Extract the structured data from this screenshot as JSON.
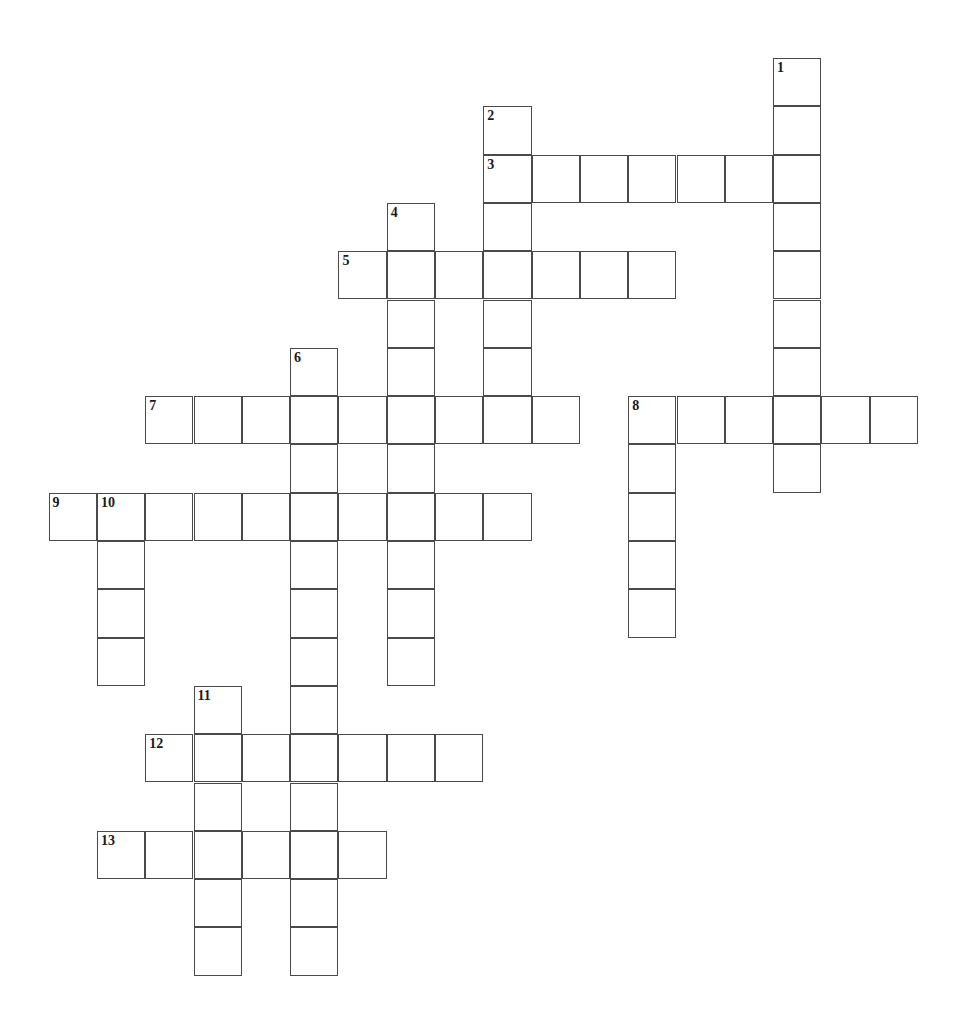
{
  "puzzle": {
    "type": "crossword-grid",
    "title": "Crossword Puzzle",
    "canvas_width": 971,
    "canvas_height": 1034,
    "background_color": "#ffffff",
    "cell_size": 48.3,
    "origin_x": 48.6,
    "origin_y": 58.0,
    "cell_border_color": "#4a4a4a",
    "cell_border_width": 1.4,
    "cell_fill_color": "#ffffff",
    "number_color": "#1a1a1a",
    "number_font_size": 14,
    "total_numbers": 13,
    "total_cells": 98,
    "entries": [
      {
        "number": "1",
        "direction": "down",
        "col": 15,
        "row": 0,
        "length": 9
      },
      {
        "number": "2",
        "direction": "down",
        "col": 9,
        "row": 1,
        "length": 7
      },
      {
        "number": "3",
        "direction": "across",
        "col": 9,
        "row": 2,
        "length": 7
      },
      {
        "number": "4",
        "direction": "down",
        "col": 7,
        "row": 3,
        "length": 10
      },
      {
        "number": "5",
        "direction": "across",
        "col": 6,
        "row": 4,
        "length": 7
      },
      {
        "number": "6",
        "direction": "down",
        "col": 5,
        "row": 6,
        "length": 13
      },
      {
        "number": "7",
        "direction": "across",
        "col": 2,
        "row": 7,
        "length": 9
      },
      {
        "number": "8",
        "direction": "across",
        "col": 12,
        "row": 7,
        "length": 6
      },
      {
        "number": "8",
        "direction": "down",
        "col": 12,
        "row": 7,
        "length": 5
      },
      {
        "number": "9",
        "direction": "across",
        "col": 0,
        "row": 9,
        "length": 10
      },
      {
        "number": "10",
        "direction": "down",
        "col": 1,
        "row": 9,
        "length": 4
      },
      {
        "number": "11",
        "direction": "down",
        "col": 3,
        "row": 13,
        "length": 6
      },
      {
        "number": "12",
        "direction": "across",
        "col": 2,
        "row": 14,
        "length": 7
      },
      {
        "number": "13",
        "direction": "across",
        "col": 1,
        "row": 16,
        "length": 6
      }
    ],
    "numbered_cells": [
      {
        "label": "1",
        "col": 15,
        "row": 0
      },
      {
        "label": "2",
        "col": 9,
        "row": 1
      },
      {
        "label": "3",
        "col": 9,
        "row": 2
      },
      {
        "label": "4",
        "col": 7,
        "row": 3
      },
      {
        "label": "5",
        "col": 6,
        "row": 4
      },
      {
        "label": "6",
        "col": 5,
        "row": 6
      },
      {
        "label": "7",
        "col": 2,
        "row": 7
      },
      {
        "label": "8",
        "col": 12,
        "row": 7
      },
      {
        "label": "9",
        "col": 0,
        "row": 9
      },
      {
        "label": "10",
        "col": 1,
        "row": 9
      },
      {
        "label": "11",
        "col": 3,
        "row": 13
      },
      {
        "label": "12",
        "col": 2,
        "row": 14
      },
      {
        "label": "13",
        "col": 1,
        "row": 16
      }
    ],
    "cells": [
      {
        "col": 15,
        "row": 0
      },
      {
        "col": 15,
        "row": 1
      },
      {
        "col": 9,
        "row": 1
      },
      {
        "col": 9,
        "row": 2
      },
      {
        "col": 10,
        "row": 2
      },
      {
        "col": 11,
        "row": 2
      },
      {
        "col": 12,
        "row": 2
      },
      {
        "col": 13,
        "row": 2
      },
      {
        "col": 14,
        "row": 2
      },
      {
        "col": 15,
        "row": 2
      },
      {
        "col": 7,
        "row": 3
      },
      {
        "col": 9,
        "row": 3
      },
      {
        "col": 15,
        "row": 3
      },
      {
        "col": 6,
        "row": 4
      },
      {
        "col": 7,
        "row": 4
      },
      {
        "col": 8,
        "row": 4
      },
      {
        "col": 9,
        "row": 4
      },
      {
        "col": 10,
        "row": 4
      },
      {
        "col": 11,
        "row": 4
      },
      {
        "col": 12,
        "row": 4
      },
      {
        "col": 15,
        "row": 4
      },
      {
        "col": 7,
        "row": 5
      },
      {
        "col": 9,
        "row": 5
      },
      {
        "col": 15,
        "row": 5
      },
      {
        "col": 5,
        "row": 6
      },
      {
        "col": 7,
        "row": 6
      },
      {
        "col": 9,
        "row": 6
      },
      {
        "col": 15,
        "row": 6
      },
      {
        "col": 2,
        "row": 7
      },
      {
        "col": 3,
        "row": 7
      },
      {
        "col": 4,
        "row": 7
      },
      {
        "col": 5,
        "row": 7
      },
      {
        "col": 6,
        "row": 7
      },
      {
        "col": 7,
        "row": 7
      },
      {
        "col": 8,
        "row": 7
      },
      {
        "col": 9,
        "row": 7
      },
      {
        "col": 10,
        "row": 7
      },
      {
        "col": 12,
        "row": 7
      },
      {
        "col": 13,
        "row": 7
      },
      {
        "col": 14,
        "row": 7
      },
      {
        "col": 15,
        "row": 7
      },
      {
        "col": 16,
        "row": 7
      },
      {
        "col": 17,
        "row": 7
      },
      {
        "col": 5,
        "row": 8
      },
      {
        "col": 7,
        "row": 8
      },
      {
        "col": 12,
        "row": 8
      },
      {
        "col": 15,
        "row": 8
      },
      {
        "col": 0,
        "row": 9
      },
      {
        "col": 1,
        "row": 9
      },
      {
        "col": 2,
        "row": 9
      },
      {
        "col": 3,
        "row": 9
      },
      {
        "col": 4,
        "row": 9
      },
      {
        "col": 5,
        "row": 9
      },
      {
        "col": 6,
        "row": 9
      },
      {
        "col": 7,
        "row": 9
      },
      {
        "col": 8,
        "row": 9
      },
      {
        "col": 9,
        "row": 9
      },
      {
        "col": 12,
        "row": 9
      },
      {
        "col": 1,
        "row": 10
      },
      {
        "col": 5,
        "row": 10
      },
      {
        "col": 7,
        "row": 10
      },
      {
        "col": 12,
        "row": 10
      },
      {
        "col": 1,
        "row": 11
      },
      {
        "col": 5,
        "row": 11
      },
      {
        "col": 7,
        "row": 11
      },
      {
        "col": 12,
        "row": 11
      },
      {
        "col": 1,
        "row": 12
      },
      {
        "col": 5,
        "row": 12
      },
      {
        "col": 7,
        "row": 12
      },
      {
        "col": 3,
        "row": 13
      },
      {
        "col": 5,
        "row": 13
      },
      {
        "col": 2,
        "row": 14
      },
      {
        "col": 3,
        "row": 14
      },
      {
        "col": 4,
        "row": 14
      },
      {
        "col": 5,
        "row": 14
      },
      {
        "col": 6,
        "row": 14
      },
      {
        "col": 7,
        "row": 14
      },
      {
        "col": 8,
        "row": 14
      },
      {
        "col": 3,
        "row": 15
      },
      {
        "col": 5,
        "row": 15
      },
      {
        "col": 1,
        "row": 16
      },
      {
        "col": 2,
        "row": 16
      },
      {
        "col": 3,
        "row": 16
      },
      {
        "col": 4,
        "row": 16
      },
      {
        "col": 5,
        "row": 16
      },
      {
        "col": 6,
        "row": 16
      },
      {
        "col": 3,
        "row": 17
      },
      {
        "col": 5,
        "row": 17
      },
      {
        "col": 3,
        "row": 18
      },
      {
        "col": 5,
        "row": 18
      }
    ]
  }
}
